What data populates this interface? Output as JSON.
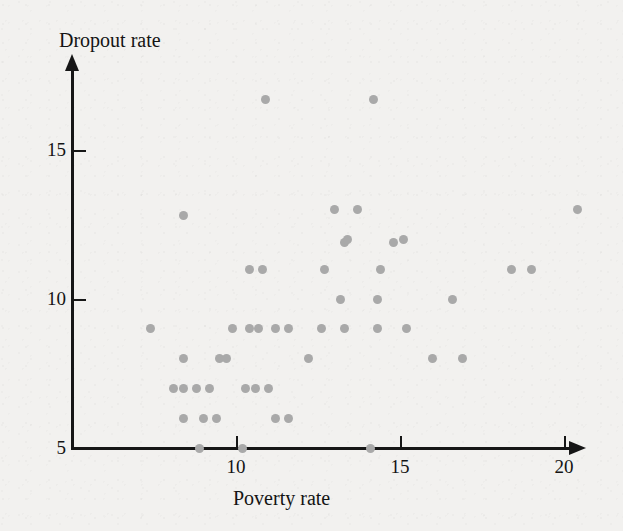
{
  "figure": {
    "y_axis_title": "Dropout rate",
    "x_axis_title": "Poverty rate",
    "point_color": "#a9a9a9",
    "axis_color": "#161616",
    "background_color": "#f2f1ef"
  },
  "chart_data": {
    "type": "scatter",
    "title": "",
    "xlabel": "Poverty rate",
    "ylabel": "Dropout rate",
    "xlim": [
      5,
      21.2
    ],
    "ylim": [
      5,
      17.7
    ],
    "xticks": [
      10,
      15,
      20
    ],
    "yticks": [
      5,
      10,
      15
    ],
    "xtick_labels": [
      "10",
      "15",
      "20"
    ],
    "ytick_labels": [
      "5",
      "10",
      "15"
    ],
    "grid": false,
    "legend": null,
    "marker": "circle",
    "points": [
      [
        8.1,
        7.0
      ],
      [
        7.4,
        9.0
      ],
      [
        8.4,
        6.0
      ],
      [
        9.0,
        6.0
      ],
      [
        9.4,
        6.0
      ],
      [
        8.4,
        7.0
      ],
      [
        8.8,
        7.0
      ],
      [
        9.2,
        7.0
      ],
      [
        8.4,
        8.0
      ],
      [
        9.5,
        8.0
      ],
      [
        9.7,
        8.0
      ],
      [
        9.9,
        9.0
      ],
      [
        8.4,
        12.8
      ],
      [
        8.9,
        5.0
      ],
      [
        10.2,
        5.0
      ],
      [
        11.2,
        6.0
      ],
      [
        11.6,
        6.0
      ],
      [
        10.3,
        7.0
      ],
      [
        10.6,
        7.0
      ],
      [
        11.0,
        7.0
      ],
      [
        10.4,
        9.0
      ],
      [
        10.7,
        9.0
      ],
      [
        11.2,
        9.0
      ],
      [
        11.6,
        9.0
      ],
      [
        10.4,
        11.0
      ],
      [
        10.8,
        11.0
      ],
      [
        10.9,
        16.7
      ],
      [
        12.2,
        8.0
      ],
      [
        12.6,
        9.0
      ],
      [
        12.7,
        11.0
      ],
      [
        13.3,
        9.0
      ],
      [
        13.2,
        10.0
      ],
      [
        13.3,
        11.9
      ],
      [
        13.4,
        12.0
      ],
      [
        13.0,
        13.0
      ],
      [
        13.7,
        13.0
      ],
      [
        14.1,
        5.0
      ],
      [
        14.2,
        16.7
      ],
      [
        14.3,
        9.0
      ],
      [
        14.4,
        11.0
      ],
      [
        14.3,
        10.0
      ],
      [
        14.8,
        11.9
      ],
      [
        15.1,
        12.0
      ],
      [
        15.2,
        9.0
      ],
      [
        16.0,
        8.0
      ],
      [
        16.6,
        10.0
      ],
      [
        16.9,
        8.0
      ],
      [
        18.4,
        11.0
      ],
      [
        19.0,
        11.0
      ],
      [
        20.4,
        13.0
      ]
    ]
  }
}
